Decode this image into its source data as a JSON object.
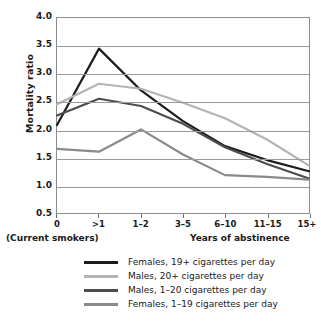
{
  "chart_data": {
    "type": "line",
    "title": "",
    "xlabel": "Years of abstinence",
    "xlabel_secondary": "(Current smokers)",
    "ylabel": "Mortality ratio",
    "categories": [
      "0",
      ">1",
      "1–2",
      "3–5",
      "6–10",
      "11–15",
      "15+"
    ],
    "ylim": [
      0.5,
      4.0
    ],
    "ytick_labels": [
      "4.5",
      "4.0",
      "3.5",
      "3.0",
      "2.5",
      "2.0",
      "1.5",
      "1.0",
      "0.5"
    ],
    "ytick_values": [
      4.5,
      4.0,
      3.5,
      3.0,
      2.5,
      2.0,
      1.5,
      1.0,
      0.5
    ],
    "grid": "horizontal",
    "legend_position": "bottom",
    "series": [
      {
        "name": "Females, 19+ cigarettes per day",
        "color": "#1c1c1c",
        "values": [
          2.08,
          3.45,
          2.7,
          2.15,
          1.7,
          1.45,
          1.25
        ]
      },
      {
        "name": "Males, 20+ cigarettes per day",
        "color": "#b4b4b4",
        "values": [
          2.45,
          2.82,
          2.73,
          2.48,
          2.2,
          1.82,
          1.35
        ]
      },
      {
        "name": "Males, 1–20 cigarettes per day",
        "color": "#4d4d4d",
        "values": [
          2.25,
          2.55,
          2.42,
          2.1,
          1.68,
          1.38,
          1.12
        ]
      },
      {
        "name": "Females, 1–19 cigarettes per day",
        "color": "#8a8a8a",
        "values": [
          1.65,
          1.6,
          2.0,
          1.55,
          1.18,
          1.15,
          1.1
        ]
      }
    ]
  }
}
